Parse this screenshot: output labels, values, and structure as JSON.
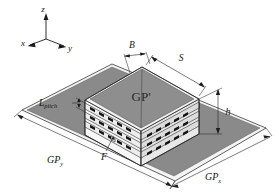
{
  "figure": {
    "type": "isometric-3d-geometry-diagram",
    "background_color": "#ffffff",
    "line_color": "#1d1d1d"
  },
  "axes": {
    "name": "coordinate-triad",
    "z_label": "z",
    "x_label": "x",
    "y_label": "y"
  },
  "labels": {
    "top_plate": "GP'",
    "width_b": "B",
    "side_s": "S",
    "layer_pitch": "L",
    "layer_pitch_sub": "pitch",
    "height_h": "h",
    "feed": "F",
    "ground_y": "GP",
    "ground_y_sub": "y",
    "ground_x": "GP",
    "ground_x_sub": "x"
  },
  "colors": {
    "ground_plane_fill": "#8a8a8a",
    "ground_plane_edge_fill": "#f2f2f2",
    "top_plate_fill": "#8e8e8e",
    "layer_light_fill": "#f4f4f4",
    "layer_side_fill": "#e2e2e2",
    "band_fill": "#efefef",
    "patch_fill": "#1a1a1a",
    "stroke": "#1d1d1d"
  },
  "structure": {
    "layer_count": 4,
    "patches_per_band_front": 9,
    "patches_per_band_right": 8
  }
}
